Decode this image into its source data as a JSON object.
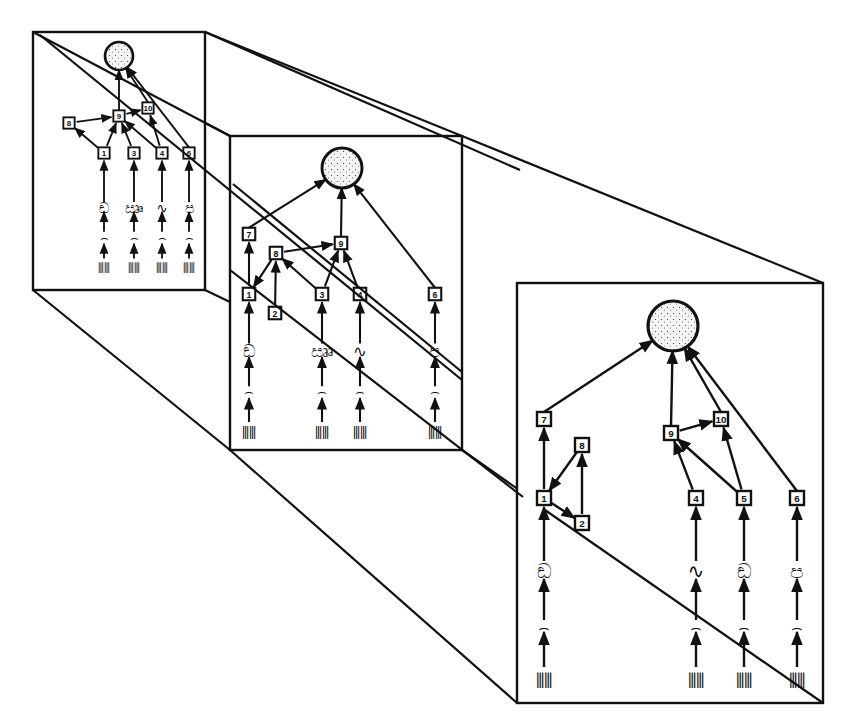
{
  "diagram": {
    "type": "perspective gene-regulatory network",
    "frames": [
      {
        "id": "frame-far",
        "rect": [
          33,
          32,
          205,
          290
        ],
        "scale": 0.55,
        "nodes": [
          {
            "label": "1",
            "x": 104,
            "y": 153
          },
          {
            "label": "3",
            "x": 134,
            "y": 153
          },
          {
            "label": "4",
            "x": 162,
            "y": 153
          },
          {
            "label": "6",
            "x": 189,
            "y": 153
          },
          {
            "label": "8",
            "x": 69,
            "y": 123
          },
          {
            "label": "9",
            "x": 119,
            "y": 116
          },
          {
            "label": "10",
            "x": 148,
            "y": 108
          }
        ],
        "complex": {
          "x": 119,
          "y": 56,
          "r": 14
        }
      },
      {
        "id": "frame-middle",
        "rect": [
          230,
          136,
          462,
          450
        ],
        "scale": 0.75,
        "nodes": [
          {
            "label": "7",
            "x": 249,
            "y": 234
          },
          {
            "label": "8",
            "x": 276,
            "y": 253
          },
          {
            "label": "9",
            "x": 341,
            "y": 243
          },
          {
            "label": "1",
            "x": 249,
            "y": 294
          },
          {
            "label": "2",
            "x": 275,
            "y": 313
          },
          {
            "label": "3",
            "x": 322,
            "y": 294
          },
          {
            "label": "4",
            "x": 360,
            "y": 294
          },
          {
            "label": "6",
            "x": 435,
            "y": 294
          }
        ],
        "complex": {
          "x": 342,
          "y": 168,
          "r": 20
        }
      },
      {
        "id": "frame-near",
        "rect": [
          517,
          283,
          823,
          703
        ],
        "scale": 1.0,
        "nodes": [
          {
            "label": "7",
            "x": 544,
            "y": 419
          },
          {
            "label": "8",
            "x": 582,
            "y": 445
          },
          {
            "label": "9",
            "x": 671,
            "y": 433
          },
          {
            "label": "10",
            "x": 721,
            "y": 419
          },
          {
            "label": "1",
            "x": 544,
            "y": 498
          },
          {
            "label": "2",
            "x": 582,
            "y": 523
          },
          {
            "label": "4",
            "x": 696,
            "y": 498
          },
          {
            "label": "5",
            "x": 744,
            "y": 498
          },
          {
            "label": "6",
            "x": 797,
            "y": 498
          }
        ],
        "complex": {
          "x": 673,
          "y": 326,
          "r": 25
        }
      }
    ],
    "layers": [
      "DNA (double helix)",
      "mRNA transcript",
      "protein (folded)",
      "numbered node",
      "complex (stippled circle)"
    ]
  }
}
